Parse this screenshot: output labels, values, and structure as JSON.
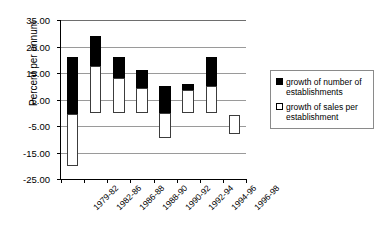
{
  "chart_data": {
    "type": "bar",
    "subtype": "stacked-floating",
    "title": "",
    "xlabel": "",
    "ylabel": "Percent per annum",
    "ylim": [
      -25.0,
      35.0
    ],
    "ytick_step": 10.0,
    "ytick_labels": [
      "35.00",
      "25.00",
      "15.00",
      "5.00",
      "-5.00",
      "-15.00",
      "-25.00"
    ],
    "ytick_values": [
      35.0,
      25.0,
      15.0,
      5.0,
      -5.0,
      -15.0,
      -25.0
    ],
    "grid": true,
    "legend_position": "right",
    "categories": [
      "1979-82",
      "1982-86",
      "1986-88",
      "1988-90",
      "1990-92",
      "1992-94",
      "1994-96",
      "1996-98"
    ],
    "series": [
      {
        "name": "growth of number of establishments",
        "fill": "black",
        "color": "#000000",
        "values": [
          21.5,
          11.5,
          8.0,
          6.5,
          10.0,
          2.5,
          11.0,
          0.0
        ]
      },
      {
        "name": "growth of sales per establishment",
        "fill": "white",
        "color": "#ffffff",
        "values": [
          -20.0,
          17.5,
          13.0,
          9.5,
          -9.5,
          8.5,
          10.0,
          -7.0
        ]
      }
    ],
    "bars": [
      {
        "category": "1979-82",
        "white_from": -20.0,
        "white_to": -0.5,
        "black_from": -0.5,
        "black_to": 21.0
      },
      {
        "category": "1982-86",
        "white_from": 0.0,
        "white_to": 17.5,
        "black_from": 17.5,
        "black_to": 29.0
      },
      {
        "category": "1986-88",
        "white_from": 0.0,
        "white_to": 13.0,
        "black_from": 13.0,
        "black_to": 21.0
      },
      {
        "category": "1988-90",
        "white_from": 0.0,
        "white_to": 9.5,
        "black_from": 9.5,
        "black_to": 16.0
      },
      {
        "category": "1990-92",
        "white_from": -9.5,
        "white_to": 0.0,
        "black_from": 0.0,
        "black_to": 10.0
      },
      {
        "category": "1992-94",
        "white_from": 0.0,
        "white_to": 8.5,
        "black_from": 8.5,
        "black_to": 11.0
      },
      {
        "category": "1994-96",
        "white_from": 0.0,
        "white_to": 10.0,
        "black_from": 10.0,
        "black_to": 21.0
      },
      {
        "category": "1996-98",
        "white_from": -8.0,
        "white_to": -1.0,
        "black_from": null,
        "black_to": null
      }
    ]
  },
  "legend": {
    "items": [
      {
        "label": "growth of number of establishments",
        "swatch": "black"
      },
      {
        "label": "growth of sales per establishment",
        "swatch": "white"
      }
    ]
  }
}
